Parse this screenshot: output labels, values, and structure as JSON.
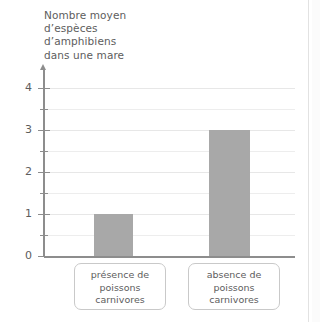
{
  "chart_data": {
    "type": "bar",
    "title": "",
    "ylabel": "Nombre moyen\nd’espèces\nd’amphibiens\ndans une mare",
    "xlabel": "",
    "categories": [
      "présence de\npoissons\ncarnivores",
      "absence de\npoissons\ncarnivores"
    ],
    "values": [
      1,
      3
    ],
    "ylim": [
      0,
      4
    ],
    "ytick_labels": [
      "0",
      "1",
      "2",
      "3",
      "4"
    ],
    "ytick_values": [
      0,
      1,
      2,
      3,
      4
    ],
    "minor_tick_values": [
      0.5,
      1.5,
      2.5,
      3.5
    ],
    "grid": true,
    "grid_axis": "y",
    "legend": false,
    "bar_color": "#a8a8a8",
    "text_color": "#5d5d5d",
    "axis_color": "#8d8d8d",
    "grid_color": "#ededed",
    "background": "#ffffff"
  }
}
